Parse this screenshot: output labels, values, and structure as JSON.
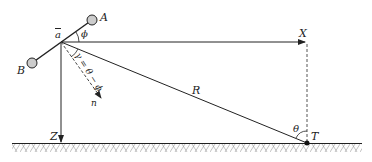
{
  "diagram": {
    "labels": {
      "A": "A",
      "B": "B",
      "origin": "a",
      "phi": "ϕ",
      "gamma": "γ = θ − ϕ",
      "n": "n",
      "X": "X",
      "Z": "Z",
      "R": "R",
      "theta": "θ",
      "T": "T"
    },
    "colors": {
      "line": "#222222",
      "dashed": "#555555",
      "node_fill": "#cccccc",
      "hatch": "#888888"
    }
  }
}
